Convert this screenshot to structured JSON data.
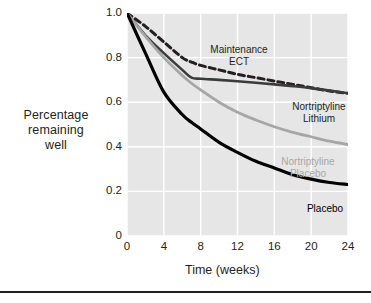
{
  "chart_data": {
    "type": "line",
    "title": "",
    "xlabel": "Time (weeks)",
    "ylabel": "Percentage remaining well",
    "xlim": [
      0,
      24
    ],
    "ylim": [
      0,
      1.0
    ],
    "xticks": [
      "0",
      "4",
      "8",
      "12",
      "16",
      "20",
      "24"
    ],
    "xtick_values": [
      0,
      4,
      8,
      12,
      16,
      20,
      24
    ],
    "yticks": [
      "0",
      "0.2",
      "0.4",
      "0.6",
      "0.8",
      "1.0"
    ],
    "ytick_values": [
      0,
      0.2,
      0.4,
      0.6,
      0.8,
      1.0
    ],
    "grid": true,
    "grid_color": "#ffffff",
    "plot_background": "#e6e6e6",
    "legend_position": "inline-annotations",
    "x": [
      0,
      2,
      4,
      6,
      7,
      8,
      10,
      12,
      14,
      16,
      18,
      20,
      22,
      24
    ],
    "series": [
      {
        "name": "Maintenance ECT",
        "label": "Maintenance\nECT",
        "color": "#231f20",
        "style": "dashed",
        "values": [
          1.0,
          0.94,
          0.87,
          0.8,
          0.78,
          0.765,
          0.745,
          0.725,
          0.71,
          0.695,
          0.68,
          0.665,
          0.65,
          0.64
        ]
      },
      {
        "name": "Nortriptyline Lithium",
        "label": "Nortriptyline\nLithium",
        "color": "#3b3b3b",
        "style": "solid",
        "values": [
          1.0,
          0.9,
          0.82,
          0.745,
          0.71,
          0.705,
          0.7,
          0.694,
          0.687,
          0.68,
          0.672,
          0.663,
          0.652,
          0.64
        ]
      },
      {
        "name": "Nortriptyline Placebo",
        "label": "Nortriptyline\nPlacebo",
        "color": "#a6a6a6",
        "style": "solid",
        "values": [
          1.0,
          0.895,
          0.8,
          0.72,
          0.685,
          0.655,
          0.6,
          0.555,
          0.52,
          0.49,
          0.465,
          0.445,
          0.425,
          0.41
        ]
      },
      {
        "name": "Placebo",
        "label": "Placebo",
        "color": "#000000",
        "style": "solid",
        "values": [
          1.0,
          0.82,
          0.645,
          0.545,
          0.51,
          0.48,
          0.42,
          0.375,
          0.335,
          0.305,
          0.275,
          0.255,
          0.24,
          0.231
        ]
      }
    ]
  },
  "axes": {
    "ylabel_text": "Percentage\nremaining\nwell",
    "xlabel_text": "Time (weeks)"
  }
}
